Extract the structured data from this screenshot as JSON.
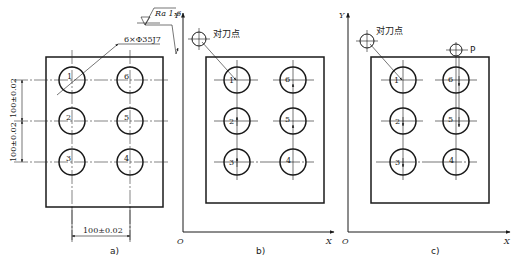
{
  "figure": {
    "panels": [
      {
        "id": "a",
        "caption": "a)",
        "hole_spec": "6×Φ35J7",
        "roughness": "Ra 1.6",
        "dim_horizontal": "100±0.02",
        "dim_vertical_upper": "100±0.02",
        "dim_vertical_lower": "100±0.02",
        "hole_labels": [
          "1",
          "2",
          "3",
          "4",
          "5",
          "6"
        ]
      },
      {
        "id": "b",
        "caption": "b)",
        "axis_y": "Y",
        "axis_x": "X",
        "origin": "O",
        "tool_point_label": "对刀点",
        "hole_labels": [
          "1",
          "2",
          "3",
          "4",
          "5",
          "6"
        ]
      },
      {
        "id": "c",
        "caption": "c)",
        "axis_y": "Y",
        "axis_x": "X",
        "origin": "O",
        "tool_point_label": "对刀点",
        "extra_point_label": "P",
        "hole_labels": [
          "1",
          "2",
          "3",
          "4",
          "5",
          "6"
        ]
      }
    ]
  }
}
